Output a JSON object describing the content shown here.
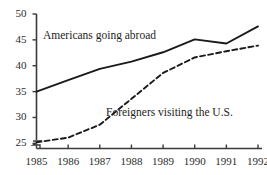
{
  "chart_data": {
    "type": "line",
    "title": "",
    "subtitle": "",
    "xlabel": "",
    "ylabel": "",
    "categories": [
      "1985",
      "1986",
      "1987",
      "1988",
      "1989",
      "1990",
      "1991",
      "1992"
    ],
    "x": [
      1985,
      1986,
      1987,
      1988,
      1989,
      1990,
      1991,
      1992
    ],
    "xlim": [
      1985,
      1992
    ],
    "ylim": [
      24,
      50
    ],
    "ytick_labels": [
      "25",
      "30",
      "35",
      "40",
      "45",
      "50"
    ],
    "yticks": [
      25,
      30,
      35,
      40,
      45,
      50
    ],
    "grid": false,
    "legend_position": "inline-annotations",
    "axis_break": true,
    "series": [
      {
        "name": "Americans going abroad",
        "style": "solid",
        "color": "#1a1a1a",
        "values": [
          35.0,
          37.2,
          39.4,
          40.8,
          42.6,
          45.1,
          44.3,
          47.6
        ]
      },
      {
        "name": "Foreigners visiting the U.S.",
        "style": "dashed",
        "color": "#1a1a1a",
        "values": [
          25.2,
          26.1,
          28.6,
          33.6,
          38.6,
          41.6,
          42.8,
          43.9
        ]
      }
    ],
    "annotations": [
      {
        "text": "Americans going abroad",
        "series": "Americans going abroad",
        "x_px": 43,
        "y_px": 30
      },
      {
        "text": "Foreigners visiting the U.S.",
        "series": "Foreigners visiting the U.S.",
        "x_px": 106,
        "y_px": 107
      }
    ]
  },
  "colors": {
    "background": "#ffffff",
    "axis": "#3a3a3a",
    "text": "#2b2b2b",
    "line": "#1a1a1a"
  }
}
